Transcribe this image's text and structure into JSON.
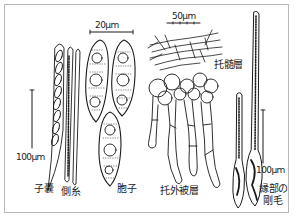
{
  "figure": {
    "colors": {
      "ink": "#1a1a1a",
      "frame": "#b8b8b8",
      "background": "#ffffff"
    },
    "scale_bars": {
      "spores": "20μm",
      "excipulum": "50μm",
      "ascus_left": "100μm",
      "setae_right": "100μm"
    },
    "labels": {
      "ascus": "子嚢",
      "paraphysis": "側糸",
      "spore": "胞子",
      "ectal_excipulum": "托外被層",
      "medullary_excipulum": "托髄層",
      "marginal_setae_line1": "縁部の",
      "marginal_setae_line2": "剛毛"
    }
  }
}
